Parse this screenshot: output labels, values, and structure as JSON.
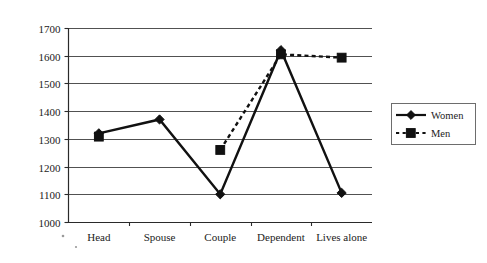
{
  "chart_data": {
    "type": "line",
    "title": "",
    "subtitle": "",
    "xlabel": "",
    "ylabel": "",
    "categories": [
      "Head",
      "Spouse",
      "Couple",
      "Dependent",
      "Lives alone"
    ],
    "ylim": [
      1000,
      1700
    ],
    "yticks": [
      1000,
      1100,
      1200,
      1300,
      1400,
      1500,
      1600,
      1700
    ],
    "ytick_labels": [
      "1000",
      "1100",
      "1200",
      "1300",
      "1400",
      "1500",
      "1600",
      "1700"
    ],
    "grid": "horizontal",
    "legend_position": "right",
    "series": [
      {
        "name": "Women",
        "line_style": "solid",
        "marker": "diamond",
        "color": "#111111",
        "values": [
          1320,
          1370,
          1100,
          1620,
          1105
        ]
      },
      {
        "name": "Men",
        "line_style": "dotted",
        "marker": "square",
        "color": "#111111",
        "values": [
          1308,
          null,
          1260,
          1605,
          1593
        ]
      }
    ]
  },
  "legend": {
    "entries": [
      {
        "label": "Women"
      },
      {
        "label": "Men"
      }
    ]
  },
  "axis": {
    "y_tick_labels": [
      "1700",
      "1600",
      "1500",
      "1400",
      "1300",
      "1200",
      "1100",
      "1000"
    ],
    "x_tick_labels": [
      "Head",
      "Spouse",
      "Couple",
      "Dependent",
      "Lives alone"
    ]
  }
}
